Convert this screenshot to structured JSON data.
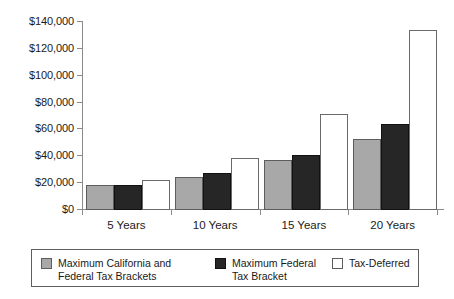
{
  "chart_data": {
    "type": "bar",
    "title": "",
    "subtitle": "",
    "xlabel": "",
    "ylabel": "",
    "categories": [
      "5 Years",
      "10 Years",
      "15 Years",
      "20 Years"
    ],
    "series": [
      {
        "name": "Maximum California and Federal Tax Brackets",
        "color": "#a8a8a8",
        "values": [
          17800,
          23700,
          36300,
          51900
        ]
      },
      {
        "name": "Maximum Federal Tax Bracket",
        "color": "#262626",
        "values": [
          17800,
          26700,
          40000,
          63000
        ]
      },
      {
        "name": "Tax-Deferred",
        "color": "#ffffff",
        "values": [
          21500,
          37800,
          70400,
          133300
        ]
      }
    ],
    "ylim": [
      0,
      140000
    ],
    "ytick_values": [
      0,
      20000,
      40000,
      60000,
      80000,
      100000,
      120000,
      140000
    ],
    "ytick_labels": [
      "$0",
      "$20,000",
      "$40,000",
      "$60,000",
      "$80,000",
      "$100,000",
      "$120,000",
      "$140,000"
    ],
    "grid": false,
    "legend_position": "bottom",
    "value_prefix": "$"
  },
  "legend": {
    "entries": [
      {
        "label": "Maximum California and Federal Tax Brackets",
        "swatch": "gray-swatch"
      },
      {
        "label": "Maximum Federal Tax Bracket",
        "swatch": "black-swatch"
      },
      {
        "label": "Tax-Deferred",
        "swatch": "white-swatch"
      }
    ]
  }
}
